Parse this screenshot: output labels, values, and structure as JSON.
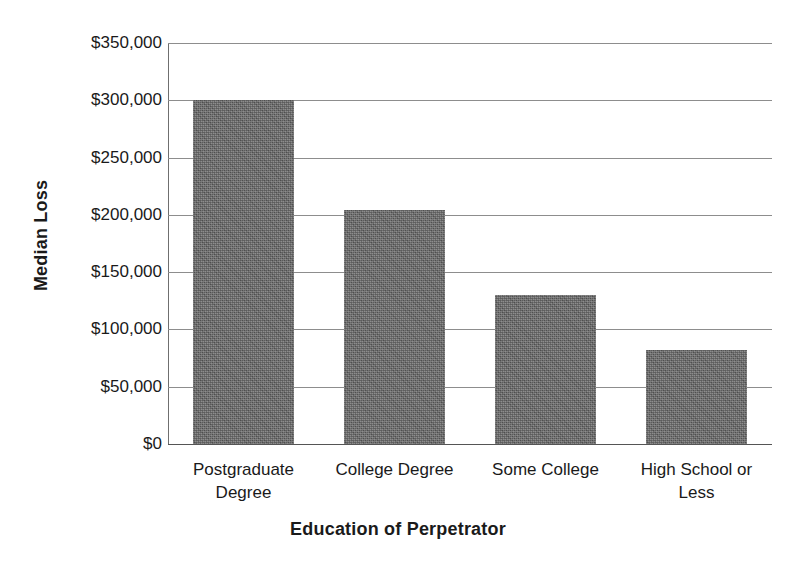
{
  "chart_data": {
    "type": "bar",
    "title": "",
    "xlabel": "Education of Perpetrator",
    "ylabel": "Median Loss",
    "categories": [
      "Postgraduate Degree",
      "College Degree",
      "Some College",
      "High School or Less"
    ],
    "category_lines": [
      [
        "Postgraduate",
        "Degree"
      ],
      [
        "College Degree",
        ""
      ],
      [
        "Some College",
        ""
      ],
      [
        "High School or",
        "Less"
      ]
    ],
    "values": [
      300000,
      204000,
      130000,
      82000
    ],
    "ylim": [
      0,
      350000
    ],
    "ytick_values": [
      0,
      50000,
      100000,
      150000,
      200000,
      250000,
      300000,
      350000
    ],
    "ytick_labels": [
      "$0",
      "$50,000",
      "$100,000",
      "$150,000",
      "$200,000",
      "$250,000",
      "$300,000",
      "$350,000"
    ],
    "grid": true,
    "legend": "none",
    "bar_color": "#676767",
    "grid_color": "#8d8d8d",
    "axis_color": "#555555"
  }
}
